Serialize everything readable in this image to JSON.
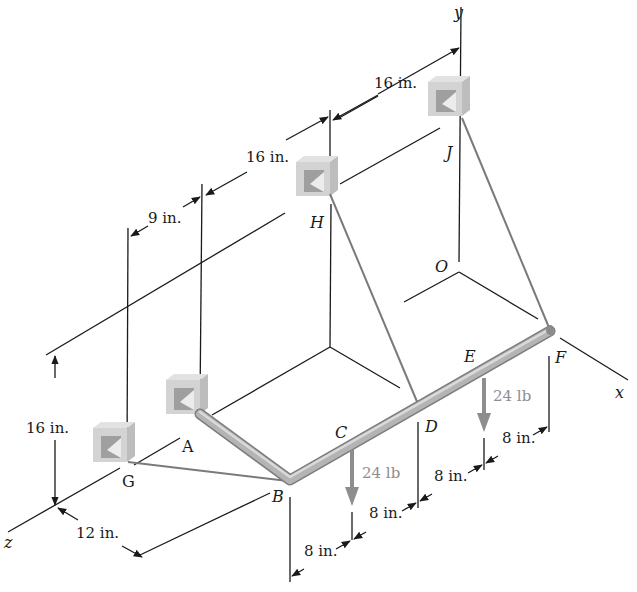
{
  "figure": {
    "axes": {
      "x": "x",
      "y": "y",
      "z": "z",
      "origin": "O"
    },
    "points": {
      "A": "A",
      "B": "B",
      "C": "C",
      "D": "D",
      "E": "E",
      "F": "F",
      "G": "G",
      "H": "H",
      "J": "J"
    },
    "loads": [
      {
        "label": "24 lb",
        "at": "between B and D (near C)"
      },
      {
        "label": "24 lb",
        "at": "between D and F (near E)"
      }
    ],
    "dimensions": {
      "top_JH": "16 in.",
      "top_HA": "16 in.",
      "top_AG": "9 in.",
      "height": "16 in.",
      "depth_z": "12 in.",
      "bottom_B_load1": "8 in.",
      "bottom_load1_D": "8 in.",
      "bottom_D_load2": "8 in.",
      "bottom_load2_F": "8 in."
    },
    "colors": {
      "line": "#1a1a1a",
      "cable": "#7a7a7a",
      "pipe": "#b0b0b0",
      "force": "#8e8e8e",
      "bracket": "#c8c8c8"
    }
  }
}
